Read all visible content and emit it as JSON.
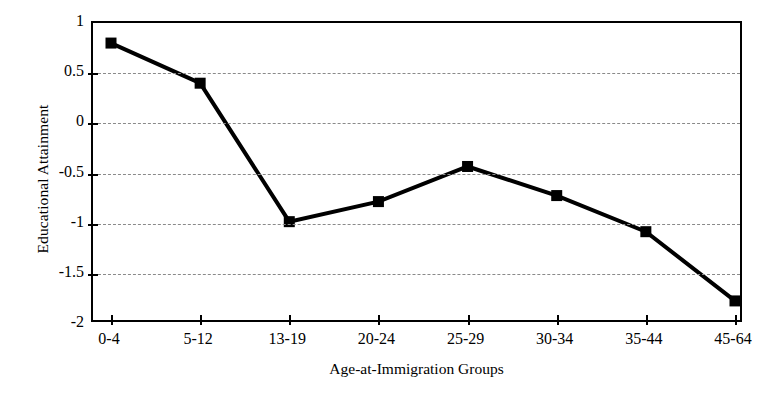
{
  "chart_data": {
    "type": "line",
    "title": "",
    "xlabel": "Age-at-Immigration Groups",
    "ylabel": "Educational Attainment",
    "categories": [
      "0-4",
      "5-12",
      "13-19",
      "20-24",
      "25-29",
      "30-34",
      "35-44",
      "45-64"
    ],
    "values": [
      0.8,
      0.4,
      -0.98,
      -0.78,
      -0.43,
      -0.72,
      -1.08,
      -1.77
    ],
    "series": [
      {
        "name": "Educational Attainment",
        "values": [
          0.8,
          0.4,
          -0.98,
          -0.78,
          -0.43,
          -0.72,
          -1.08,
          -1.77
        ]
      }
    ],
    "ylim": [
      -2,
      1
    ],
    "ytick_labels": [
      "1",
      "0.5",
      "0",
      "-0.5",
      "-1",
      "-1.5",
      "-2"
    ],
    "ytick_values": [
      1,
      0.5,
      0,
      -0.5,
      -1,
      -1.5,
      -2
    ],
    "grid": "horizontal-dashed",
    "legend": "none",
    "marker": "filled-square",
    "line_color": "#000000",
    "marker_color": "#000000",
    "grid_color": "#8a8a8a",
    "axis_color": "#000000",
    "background": "#ffffff"
  }
}
